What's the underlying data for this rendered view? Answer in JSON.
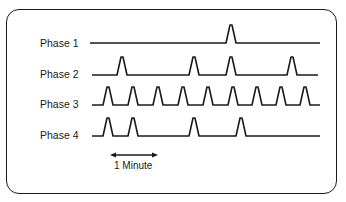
{
  "diagram": {
    "type": "pulse-timing-diagram",
    "rows": [
      {
        "label": "Phase 1",
        "baseline_y": 43,
        "x_start": 90,
        "x_end": 320,
        "peaks_x": [
          231
        ]
      },
      {
        "label": "Phase 2",
        "baseline_y": 75,
        "x_start": 92,
        "x_end": 318,
        "peaks_x": [
          122,
          194,
          231,
          292
        ]
      },
      {
        "label": "Phase 3",
        "baseline_y": 105,
        "x_start": 92,
        "x_end": 320,
        "peaks_x": [
          108,
          133,
          158,
          183,
          208,
          233,
          257,
          281,
          305
        ]
      },
      {
        "label": "Phase 4",
        "baseline_y": 136,
        "x_start": 92,
        "x_end": 320,
        "peaks_x": [
          108,
          133,
          194,
          241
        ]
      }
    ],
    "scale": {
      "label": "1 Minute",
      "x_start": 110,
      "x_end": 158,
      "y": 155
    },
    "colors": {
      "stroke": "#1a1a1a",
      "background": "#ffffff"
    }
  }
}
